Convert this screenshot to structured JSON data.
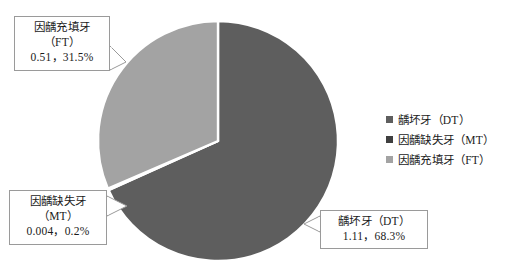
{
  "chart_data": {
    "type": "pie",
    "title": "",
    "subtitle": "",
    "xlabel": "",
    "ylabel": "",
    "grid": false,
    "legend_position": "right",
    "start_angle_deg": 0,
    "direction": "clockwise",
    "categories": [
      "龋坏牙（DT）",
      "因龋缺失牙（MT）",
      "因龋充填牙（FT）"
    ],
    "values": [
      1.11,
      0.004,
      0.51
    ],
    "percents": [
      68.3,
      0.2,
      31.5
    ],
    "colors": [
      "#5e5e5e",
      "#3f3f3f",
      "#a3a3a3"
    ],
    "slices": [
      {
        "name": "龋坏牙（DT）",
        "value": 1.11,
        "percent": 68.3,
        "color": "#5e5e5e"
      },
      {
        "name": "因龋缺失牙（MT）",
        "value": 0.004,
        "percent": 0.2,
        "color": "#3f3f3f"
      },
      {
        "name": "因龋充填牙（FT）",
        "value": 0.51,
        "percent": 31.5,
        "color": "#a3a3a3"
      }
    ],
    "annotations": [
      {
        "id": "ft",
        "lines": [
          "因龋充填牙",
          "（FT）",
          "0.51，31.5%"
        ]
      },
      {
        "id": "mt",
        "lines": [
          "因龋缺失牙",
          "（MT）",
          "0.004，0.2%"
        ]
      },
      {
        "id": "dt",
        "lines": [
          "龋坏牙（DT）",
          "1.11，68.3%"
        ]
      }
    ]
  },
  "callouts": {
    "ft": {
      "line1": "因龋充填牙",
      "line2": "（FT）",
      "line3": "0.51，31.5%"
    },
    "mt": {
      "line1": "因龋缺失牙",
      "line2": "（MT）",
      "line3": "0.004，0.2%"
    },
    "dt": {
      "line1": "龋坏牙（DT）",
      "line2": "1.11，68.3%"
    }
  },
  "legend": {
    "items": [
      {
        "label": "龋坏牙（DT）",
        "color": "#5e5e5e"
      },
      {
        "label": "因龋缺失牙（MT）",
        "color": "#3f3f3f"
      },
      {
        "label": "因龋充填牙（FT）",
        "color": "#a3a3a3"
      }
    ]
  },
  "pie_geometry": {
    "cx": 218,
    "cy": 141,
    "r": 120
  }
}
